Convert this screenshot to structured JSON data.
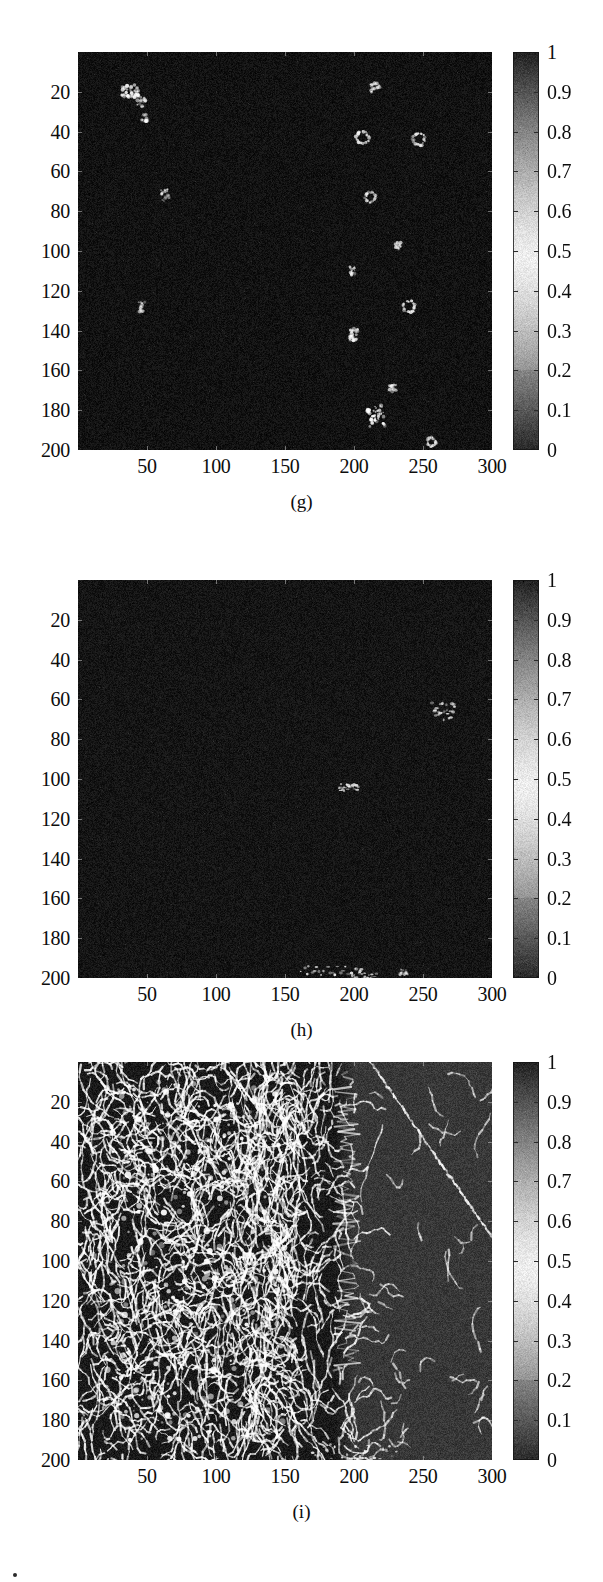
{
  "figure": {
    "panel_count": 3,
    "background_color": "#ffffff",
    "text_color": "#0d0d0d"
  },
  "chart_data": [
    {
      "type": "heatmap",
      "title": "",
      "caption": "(g)",
      "xlabel": "",
      "ylabel": "",
      "xlim": [
        0,
        300
      ],
      "ylim": [
        200,
        0
      ],
      "xticks": [
        50,
        100,
        150,
        200,
        250,
        300
      ],
      "yticks": [
        20,
        40,
        60,
        80,
        100,
        120,
        140,
        160,
        180,
        200
      ],
      "grid": false,
      "colormap": "gray",
      "colorbar": {
        "position": "right",
        "vmin": 0,
        "vmax": 1,
        "ticks": [
          "1",
          "0.9",
          "0.8",
          "0.7",
          "0.6",
          "0.5",
          "0.4",
          "0.3",
          "0.2",
          "0.1",
          "0"
        ],
        "tick_values": [
          1,
          0.9,
          0.8,
          0.7,
          0.6,
          0.5,
          0.4,
          0.3,
          0.2,
          0.1,
          0
        ]
      },
      "background_level": 0.07,
      "noise_amplitude": 0.05,
      "description": "Mostly dark field with sparse small bright blobs",
      "features": [
        {
          "x": 38,
          "y": 20,
          "w": 13,
          "h": 7,
          "peak": 0.95,
          "shape": "cluster"
        },
        {
          "x": 46,
          "y": 25,
          "w": 6,
          "h": 5,
          "peak": 0.72,
          "shape": "blob"
        },
        {
          "x": 48,
          "y": 33,
          "w": 4,
          "h": 4,
          "peak": 0.7,
          "shape": "blob"
        },
        {
          "x": 63,
          "y": 72,
          "w": 6,
          "h": 6,
          "peak": 0.8,
          "shape": "blob"
        },
        {
          "x": 46,
          "y": 128,
          "w": 5,
          "h": 5,
          "peak": 0.62,
          "shape": "blob"
        },
        {
          "x": 215,
          "y": 18,
          "w": 7,
          "h": 6,
          "peak": 0.84,
          "shape": "blob"
        },
        {
          "x": 206,
          "y": 43,
          "w": 8,
          "h": 7,
          "peak": 0.86,
          "shape": "ring"
        },
        {
          "x": 247,
          "y": 44,
          "w": 8,
          "h": 7,
          "peak": 0.84,
          "shape": "ring"
        },
        {
          "x": 212,
          "y": 73,
          "w": 6,
          "h": 6,
          "peak": 0.78,
          "shape": "ring"
        },
        {
          "x": 232,
          "y": 97,
          "w": 4,
          "h": 4,
          "peak": 0.7,
          "shape": "blob"
        },
        {
          "x": 199,
          "y": 110,
          "w": 4,
          "h": 5,
          "peak": 0.68,
          "shape": "blob"
        },
        {
          "x": 240,
          "y": 128,
          "w": 8,
          "h": 7,
          "peak": 0.85,
          "shape": "ring"
        },
        {
          "x": 200,
          "y": 142,
          "w": 6,
          "h": 6,
          "peak": 0.8,
          "shape": "cluster"
        },
        {
          "x": 228,
          "y": 169,
          "w": 5,
          "h": 4,
          "peak": 0.72,
          "shape": "blob"
        },
        {
          "x": 216,
          "y": 183,
          "w": 13,
          "h": 11,
          "peak": 0.96,
          "shape": "cluster"
        },
        {
          "x": 256,
          "y": 196,
          "w": 6,
          "h": 5,
          "peak": 0.78,
          "shape": "ring"
        }
      ]
    },
    {
      "type": "heatmap",
      "title": "",
      "caption": "(h)",
      "xlabel": "",
      "ylabel": "",
      "xlim": [
        0,
        300
      ],
      "ylim": [
        200,
        0
      ],
      "xticks": [
        50,
        100,
        150,
        200,
        250,
        300
      ],
      "yticks": [
        20,
        40,
        60,
        80,
        100,
        120,
        140,
        160,
        180,
        200
      ],
      "grid": false,
      "colormap": "gray",
      "colorbar": {
        "position": "right",
        "vmin": 0,
        "vmax": 1,
        "ticks": [
          "1",
          "0.9",
          "0.8",
          "0.7",
          "0.6",
          "0.5",
          "0.4",
          "0.3",
          "0.2",
          "0.1",
          "0"
        ],
        "tick_values": [
          1,
          0.9,
          0.8,
          0.7,
          0.6,
          0.5,
          0.4,
          0.3,
          0.2,
          0.1,
          0
        ]
      },
      "background_level": 0.08,
      "noise_amplitude": 0.05,
      "description": "Near-uniform dark field with a few faint linear streaks",
      "features": [
        {
          "x": 265,
          "y": 66,
          "w": 16,
          "h": 9,
          "peak": 0.88,
          "shape": "streak"
        },
        {
          "x": 196,
          "y": 104,
          "w": 14,
          "h": 4,
          "peak": 0.8,
          "shape": "streak"
        },
        {
          "x": 185,
          "y": 196,
          "w": 46,
          "h": 5,
          "peak": 0.9,
          "shape": "streak"
        },
        {
          "x": 208,
          "y": 199,
          "w": 18,
          "h": 4,
          "peak": 0.74,
          "shape": "streak"
        },
        {
          "x": 236,
          "y": 197,
          "w": 6,
          "h": 3,
          "peak": 0.58,
          "shape": "blob"
        }
      ]
    },
    {
      "type": "heatmap",
      "title": "",
      "caption": "(i)",
      "xlabel": "",
      "ylabel": "",
      "xlim": [
        0,
        300
      ],
      "ylim": [
        200,
        0
      ],
      "xticks": [
        50,
        100,
        150,
        200,
        250,
        300
      ],
      "yticks": [
        20,
        40,
        60,
        80,
        100,
        120,
        140,
        160,
        180,
        200
      ],
      "grid": false,
      "colormap": "gray",
      "colorbar": {
        "position": "right",
        "vmin": 0,
        "vmax": 1,
        "ticks": [
          "1",
          "0.9",
          "0.8",
          "0.7",
          "0.6",
          "0.5",
          "0.4",
          "0.3",
          "0.2",
          "0.1",
          "0"
        ],
        "tick_values": [
          1,
          0.9,
          0.8,
          0.7,
          0.6,
          0.5,
          0.4,
          0.3,
          0.2,
          0.1,
          0
        ]
      },
      "background_level": 0.1,
      "right_region_level": 0.22,
      "right_region_start_x": 200,
      "noise_amplitude": 0.06,
      "description": "Dense bright filamentary network on the left, smoother lighter region on the right crossed by a long bright diagonal line",
      "filament_density_left": 0.45,
      "filament_density_mid": 0.22,
      "filament_density_right": 0.06,
      "features": [
        {
          "x": 260,
          "y": 48,
          "w": 120,
          "h": 120,
          "peak": 0.92,
          "shape": "diagonal-line"
        },
        {
          "x": 195,
          "y": 80,
          "w": 20,
          "h": 150,
          "peak": 0.85,
          "shape": "vertical-edge"
        },
        {
          "x": 200,
          "y": 196,
          "w": 60,
          "h": 8,
          "peak": 0.9,
          "shape": "streak"
        }
      ]
    }
  ],
  "colorbar_shared": {
    "ticks": [
      "1",
      "0.9",
      "0.8",
      "0.7",
      "0.6",
      "0.5",
      "0.4",
      "0.3",
      "0.2",
      "0.1",
      "0"
    ]
  }
}
